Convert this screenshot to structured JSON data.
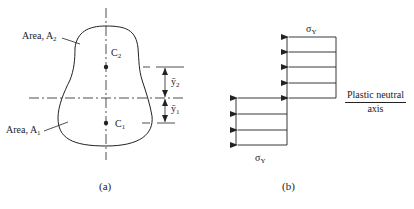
{
  "figure_a": {
    "caption": "(a)",
    "area_top_label": "Area, A",
    "area_top_sub": "2",
    "area_bottom_label": "Area, A",
    "area_bottom_sub": "1",
    "centroid_top": "C",
    "centroid_top_sub": "2",
    "centroid_bottom": "C",
    "centroid_bottom_sub": "1",
    "dim_top": "ȳ",
    "dim_top_sub": "2",
    "dim_bottom": "ȳ",
    "dim_bottom_sub": "1"
  },
  "figure_b": {
    "caption": "(b)",
    "stress_top": "σ",
    "stress_top_sub": "Y",
    "stress_bottom": "σ",
    "stress_bottom_sub": "Y",
    "axis_label_line1": "Plastic neutral",
    "axis_label_line2": "axis"
  },
  "colors": {
    "line": "#222222",
    "background": "#ffffff"
  }
}
